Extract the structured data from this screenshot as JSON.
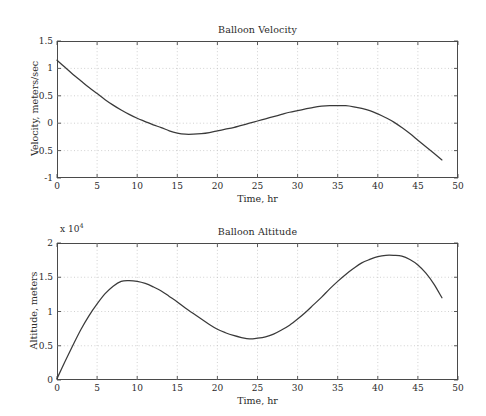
{
  "figure": {
    "background_color": "#ffffff",
    "line_color": "#3a3a3a",
    "axis_color": "#4a4a4a",
    "grid_color": "#bdbdbd"
  },
  "chart_data": [
    {
      "type": "line",
      "title": "Balloon Velocity",
      "xlabel": "Time, hr",
      "ylabel": "Velocity, meters/sec",
      "xlim": [
        0,
        50
      ],
      "ylim": [
        -1,
        1.5
      ],
      "xticks": [
        0,
        5,
        10,
        15,
        20,
        25,
        30,
        35,
        40,
        45,
        50
      ],
      "xticklabels": [
        "0",
        "5",
        "10",
        "15",
        "20",
        "25",
        "30",
        "35",
        "40",
        "45",
        "50"
      ],
      "yticks": [
        -1,
        -0.5,
        0,
        0.5,
        1,
        1.5
      ],
      "yticklabels": [
        "-1",
        "-0.5",
        "0",
        "0.5",
        "1",
        "1.5"
      ],
      "grid": true,
      "grid_style": "dotted",
      "legend": null,
      "y_exponent": null,
      "x": [
        0,
        1,
        2,
        3,
        4,
        5,
        6,
        7,
        8,
        9,
        10,
        11,
        12,
        13,
        14,
        15,
        16,
        17,
        18,
        19,
        20,
        21,
        22,
        23,
        24,
        25,
        26,
        27,
        28,
        29,
        30,
        31,
        32,
        33,
        34,
        35,
        36,
        37,
        38,
        39,
        40,
        41,
        42,
        43,
        44,
        45,
        46,
        47,
        48
      ],
      "y": [
        1.15,
        1.02,
        0.89,
        0.77,
        0.65,
        0.54,
        0.43,
        0.33,
        0.24,
        0.16,
        0.09,
        0.03,
        -0.03,
        -0.08,
        -0.14,
        -0.18,
        -0.2,
        -0.2,
        -0.19,
        -0.17,
        -0.14,
        -0.11,
        -0.08,
        -0.04,
        0.0,
        0.04,
        0.08,
        0.12,
        0.16,
        0.2,
        0.23,
        0.26,
        0.29,
        0.31,
        0.32,
        0.32,
        0.32,
        0.3,
        0.27,
        0.23,
        0.17,
        0.1,
        0.02,
        -0.08,
        -0.19,
        -0.31,
        -0.43,
        -0.55,
        -0.67
      ]
    },
    {
      "type": "line",
      "title": "Balloon Altitude",
      "xlabel": "Time, hr",
      "ylabel": "Altitude, meters",
      "xlim": [
        0,
        50
      ],
      "ylim": [
        0,
        2
      ],
      "xticks": [
        0,
        5,
        10,
        15,
        20,
        25,
        30,
        35,
        40,
        45,
        50
      ],
      "xticklabels": [
        "0",
        "5",
        "10",
        "15",
        "20",
        "25",
        "30",
        "35",
        "40",
        "45",
        "50"
      ],
      "yticks": [
        0,
        0.5,
        1,
        1.5,
        2
      ],
      "yticklabels": [
        "0",
        "0.5",
        "1",
        "1.5",
        "2"
      ],
      "grid": true,
      "grid_style": "dotted",
      "legend": null,
      "y_exponent": "x 10",
      "y_exponent_power": "4",
      "x": [
        0,
        1,
        2,
        3,
        4,
        5,
        6,
        7,
        8,
        9,
        10,
        11,
        12,
        13,
        14,
        15,
        16,
        17,
        18,
        19,
        20,
        21,
        22,
        23,
        24,
        25,
        26,
        27,
        28,
        29,
        30,
        31,
        32,
        33,
        34,
        35,
        36,
        37,
        38,
        39,
        40,
        41,
        42,
        43,
        44,
        45,
        46,
        47,
        48
      ],
      "y": [
        0.02,
        0.27,
        0.51,
        0.74,
        0.94,
        1.11,
        1.26,
        1.37,
        1.44,
        1.45,
        1.44,
        1.41,
        1.36,
        1.3,
        1.22,
        1.14,
        1.05,
        0.97,
        0.89,
        0.81,
        0.74,
        0.69,
        0.65,
        0.62,
        0.6,
        0.61,
        0.63,
        0.67,
        0.73,
        0.8,
        0.89,
        0.99,
        1.1,
        1.21,
        1.33,
        1.44,
        1.54,
        1.63,
        1.71,
        1.76,
        1.8,
        1.82,
        1.82,
        1.81,
        1.76,
        1.68,
        1.56,
        1.4,
        1.2
      ]
    }
  ]
}
